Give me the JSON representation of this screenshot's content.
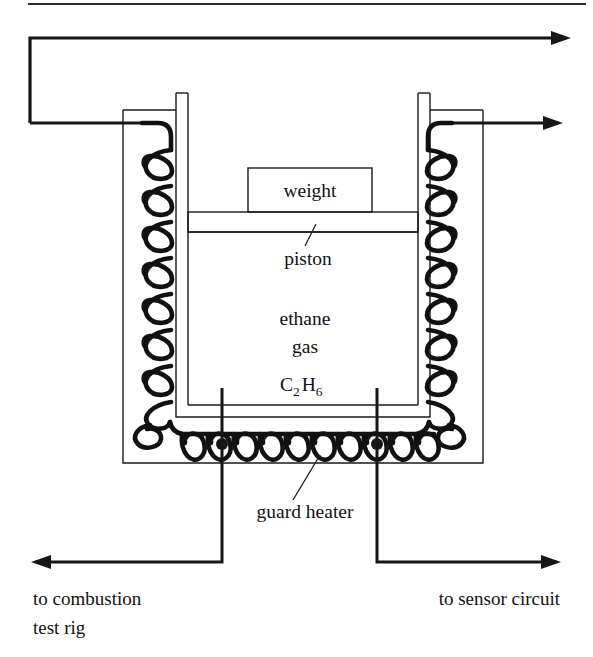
{
  "figure": {
    "background_color": "#ffffff",
    "line_color": "#161616",
    "width": 593,
    "height": 657
  },
  "labels": {
    "weight": "weight",
    "piston": "piston",
    "gas_name_line1": "ethane",
    "gas_name_line2": "gas",
    "gas_formula_c": "C",
    "gas_formula_sub2": "2",
    "gas_formula_h": "H",
    "gas_formula_sub6": "6",
    "guard_heater": "guard  heater",
    "to_combustion_line1": "to combustion",
    "to_combustion_line2": "test rig",
    "to_sensor": "to sensor circuit"
  },
  "components": {
    "outer_enclosure": "outer-enclosure-box",
    "vessel_wall": "double-walled-vessel",
    "gas_chamber": "ethane-gas-chamber",
    "piston_bar": "piston-bar",
    "weight_block": "weight-block",
    "left_heater_coil": "left-side-heater-coil",
    "right_heater_coil": "right-side-heater-coil",
    "bottom_heater_coil": "bottom-guard-heater-coil",
    "top_lead_wire": "top-lead-wire",
    "right_lead_wire": "right-lead-wire",
    "left_bottom_lead": "left-bottom-lead-wire",
    "right_bottom_lead": "right-bottom-lead-wire",
    "top_rule": "top-separator-rule"
  },
  "arrows": {
    "top": {
      "direction": "right",
      "name": "top-arrow-right"
    },
    "upper_right": {
      "direction": "right",
      "name": "upper-right-arrow"
    },
    "bottom_left": {
      "direction": "left",
      "name": "bottom-left-arrow"
    },
    "bottom_right": {
      "direction": "right",
      "name": "bottom-right-arrow"
    }
  }
}
